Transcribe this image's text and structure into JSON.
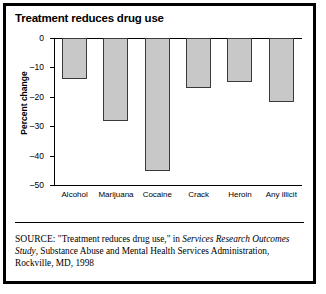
{
  "figure": {
    "title": "Treatment reduces drug use",
    "source_prefix": "SOURCE:",
    "source_part1": " \"Treatment reduces drug use,\" in ",
    "source_italic": "Services Research Outcomes Study",
    "source_part2": ", Substance Abuse and Mental Health Services Administration, Rockville, MD, 1998"
  },
  "chart_data": {
    "type": "bar",
    "title": "Treatment reduces drug use",
    "xlabel": "",
    "ylabel": "Percent change",
    "categories": [
      "Alcohol",
      "Marijuana",
      "Cocaine",
      "Crack",
      "Heroin",
      "Any illicit"
    ],
    "values": [
      -14,
      -28,
      -45,
      -17,
      -15,
      -21.5
    ],
    "ylim": [
      -50,
      0
    ],
    "yticks": [
      0,
      -10,
      -20,
      -30,
      -40,
      -50
    ],
    "ytick_labels": [
      "0",
      "–10",
      "–20",
      "–30",
      "–40",
      "–50"
    ],
    "grid": false,
    "legend": false,
    "bar_fill": "#c8c8c8",
    "bar_border": "#3a3a3a"
  }
}
